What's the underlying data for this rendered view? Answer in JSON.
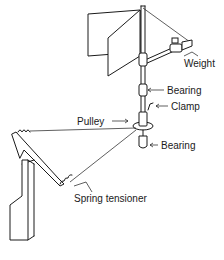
{
  "diagram": {
    "type": "mechanical-illustration",
    "line_color": "#1a1a1a",
    "background": "#ffffff",
    "labels": {
      "weight": "Weight",
      "bearing_upper": "Bearing",
      "clamp": "Clamp",
      "pulley": "Pulley",
      "bearing_lower": "Bearing",
      "spring_tensioner": "Spring tensioner"
    },
    "components": [
      "vane-fin",
      "vertical-shaft",
      "counterweight-arm",
      "weight",
      "upper-bearing",
      "clamp",
      "pulley",
      "lower-bearing",
      "cable",
      "spring-tensioner",
      "bracket-arm",
      "rudder-plate"
    ]
  }
}
